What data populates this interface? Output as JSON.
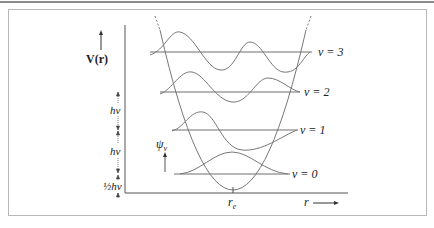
{
  "figure": {
    "y_axis_label": "V(r)",
    "x_axis_label": "r",
    "equilibrium_label": "r",
    "equilibrium_subscript": "e",
    "wavefunction_label": "ψ",
    "wavefunction_subscript": "v",
    "spacing_labels": [
      "hν",
      "hν",
      "½hν"
    ],
    "levels": [
      {
        "label": "v = 3",
        "y": 52,
        "x1": 150,
        "x2": 310,
        "label_x": 316
      },
      {
        "label": "v = 2",
        "y": 92,
        "x1": 160,
        "x2": 298,
        "label_x": 302
      },
      {
        "label": "v = 1",
        "y": 130,
        "x1": 172,
        "x2": 296,
        "label_x": 298
      },
      {
        "label": "v = 0",
        "y": 174,
        "x1": 174,
        "x2": 288,
        "label_x": 290
      }
    ],
    "colors": {
      "line": "#6e6e6e",
      "curve": "#777777",
      "text": "#222222",
      "frame": "#b8b8b8"
    }
  }
}
